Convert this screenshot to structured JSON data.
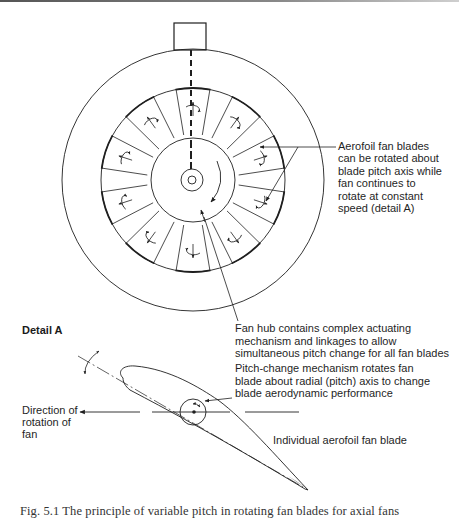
{
  "labels": {
    "aerofoil_blades": [
      "Aerofoil fan blades",
      "can be rotated about",
      "blade pitch axis while",
      "fan continues to",
      "rotate at constant",
      "speed (detail A)"
    ],
    "fan_hub": [
      "Fan hub contains complex actuating",
      "mechanism and linkages to allow",
      "simultaneous pitch change for all fan blades"
    ],
    "pitch_change": [
      "Pitch-change mechanism rotates fan",
      "blade about radial (pitch) axis to change",
      "blade aerodynamic performance"
    ],
    "detail_title": "Detail A",
    "direction": [
      "Direction of",
      "rotation of",
      "fan"
    ],
    "individual_blade": "Individual aerofoil fan blade"
  },
  "caption": "Fig. 5.1  The principle of variable pitch in rotating fan blades for axial fans",
  "geometry": {
    "center": [
      193,
      180
    ],
    "outer_radius": 131,
    "ring_radius": 92,
    "hub_radius": 42,
    "blade_count": 10,
    "blade_angles_deg": [
      -72,
      -36,
      0,
      36,
      72,
      108,
      144,
      180,
      216,
      252
    ]
  },
  "colors": {
    "line": "#1f1f1f",
    "background": "#ffffff"
  }
}
